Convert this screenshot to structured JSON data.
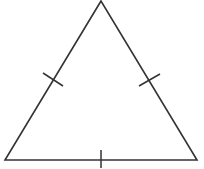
{
  "diagram": {
    "type": "geometry",
    "shape": "equilateral-triangle",
    "stroke_color": "#333333",
    "background": "#ffffff",
    "vertices": {
      "apex": [
        101,
        1
      ],
      "bottom_left": [
        5,
        160
      ],
      "bottom_right": [
        197,
        160
      ]
    },
    "congruence_marks": [
      {
        "side": "left",
        "from": [
          43,
          73
        ],
        "to": [
          63,
          86
        ]
      },
      {
        "side": "right",
        "from": [
          139,
          86
        ],
        "to": [
          160,
          74
        ]
      },
      {
        "side": "bottom",
        "from": [
          101,
          150
        ],
        "to": [
          101,
          168
        ]
      }
    ]
  }
}
